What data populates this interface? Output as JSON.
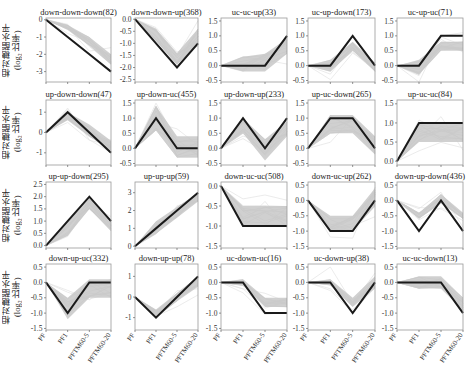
{
  "chart_data": {
    "type": "line",
    "layout": {
      "rows": 4,
      "cols": 5,
      "grid": false,
      "legend": "none"
    },
    "ylabel": "相对糖酯水平\n(log2 比率)",
    "ylabel_lines": [
      "相对糖酯水平",
      "(log",
      "2",
      " 比率)"
    ],
    "x": [
      "PF",
      "PF1",
      "PFTM60-5",
      "PFTM60-20"
    ],
    "xtick_labels": [
      "PF",
      "PF1",
      "PFTM60-5",
      "PFTM60-20"
    ],
    "background_lines_color": "#c8c8c8",
    "representative_line_color": "#1a1a1a",
    "panels": [
      {
        "title": "down-down-down(82)",
        "values": [
          0,
          -1,
          -2,
          -3
        ],
        "ylim": [
          -3.6,
          0.1
        ],
        "yticks": [
          0,
          -1,
          -2,
          -3
        ],
        "yticklabels": [
          "0",
          "-1",
          "-2",
          "-3"
        ],
        "band": [
          [
            0,
            0
          ],
          [
            -0.6,
            -0.3
          ],
          [
            -1.5,
            -1.0
          ],
          [
            -2.6,
            -2.0
          ]
        ]
      },
      {
        "title": "down-down-up(368)",
        "values": [
          0,
          -1,
          -2,
          -1
        ],
        "ylim": [
          -2.6,
          0.05
        ],
        "yticks": [
          0,
          -0.5,
          -1,
          -1.5,
          -2,
          -2.5
        ],
        "yticklabels": [
          "0.0",
          "-0.5",
          "-1.0",
          "-1.5",
          "-2.0",
          "-2.5"
        ],
        "band": [
          [
            0,
            0
          ],
          [
            -0.9,
            -0.4
          ],
          [
            -1.9,
            -1.4
          ],
          [
            -1.0,
            -0.4
          ]
        ]
      },
      {
        "title": "uc-uc-up(33)",
        "values": [
          0,
          0,
          0,
          1
        ],
        "ylim": [
          -0.55,
          1.6
        ],
        "yticks": [
          1.5,
          1.0,
          0.5,
          0.0,
          -0.5
        ],
        "yticklabels": [
          "1.5",
          "1.0",
          "0.5",
          "0.0",
          "-0.5"
        ],
        "band": [
          [
            0,
            0
          ],
          [
            -0.2,
            0.3
          ],
          [
            -0.2,
            0.4
          ],
          [
            0.4,
            0.9
          ]
        ]
      },
      {
        "title": "uc-up-down(173)",
        "values": [
          0,
          0,
          1,
          0
        ],
        "ylim": [
          -0.55,
          1.6
        ],
        "yticks": [
          1.5,
          1.0,
          0.5,
          0.0,
          -0.5
        ],
        "yticklabels": [
          "1.5",
          "1.0",
          "0.5",
          "0.0",
          "-0.5"
        ],
        "band": [
          [
            0,
            0
          ],
          [
            -0.2,
            0.2
          ],
          [
            0.5,
            0.8
          ],
          [
            -0.2,
            0.1
          ]
        ]
      },
      {
        "title": "uc-up-uc(71)",
        "values": [
          0,
          0,
          1,
          1
        ],
        "ylim": [
          -0.55,
          1.6
        ],
        "yticks": [
          1.5,
          1.0,
          0.5,
          0.0,
          -0.5
        ],
        "yticklabels": [
          "1.5",
          "1.0",
          "0.5",
          "0.0",
          "-0.5"
        ],
        "band": [
          [
            0,
            0
          ],
          [
            -0.3,
            0.2
          ],
          [
            0.5,
            0.8
          ],
          [
            0.5,
            0.8
          ]
        ]
      },
      {
        "title": "up-down-down(47)",
        "values": [
          0,
          1,
          0,
          -1
        ],
        "ylim": [
          -1.6,
          1.6
        ],
        "yticks": [
          1,
          0,
          -1
        ],
        "yticklabels": [
          "1",
          "0",
          "-1"
        ],
        "band": [
          [
            0,
            0
          ],
          [
            0.6,
            1.0
          ],
          [
            -0.2,
            0.4
          ],
          [
            -0.9,
            -0.4
          ]
        ]
      },
      {
        "title": "up-down-uc(455)",
        "values": [
          0,
          1,
          0,
          0
        ],
        "ylim": [
          -0.55,
          1.6
        ],
        "yticks": [
          1.5,
          1.0,
          0.5,
          0.0,
          -0.5
        ],
        "yticklabels": [
          "1.5",
          "1.0",
          "0.5",
          "0.0",
          "-0.5"
        ],
        "band": [
          [
            0,
            0
          ],
          [
            0.6,
            1.4
          ],
          [
            -0.3,
            0.4
          ],
          [
            -0.3,
            0.4
          ]
        ]
      },
      {
        "title": "up-down-up(233)",
        "values": [
          0,
          1,
          0,
          1
        ],
        "ylim": [
          -0.55,
          1.6
        ],
        "yticks": [
          1.5,
          1.0,
          0.5,
          0.0,
          -0.5
        ],
        "yticklabels": [
          "1.5",
          "1.0",
          "0.5",
          "0.0",
          "-0.5"
        ],
        "band": [
          [
            0,
            0
          ],
          [
            0.5,
            1.0
          ],
          [
            -0.4,
            0.3
          ],
          [
            0.4,
            0.9
          ]
        ]
      },
      {
        "title": "up-uc-down(265)",
        "values": [
          0,
          1,
          1,
          0
        ],
        "ylim": [
          -0.55,
          1.6
        ],
        "yticks": [
          1.5,
          1.0,
          0.5,
          0.0,
          -0.5
        ],
        "yticklabels": [
          "1.5",
          "1.0",
          "0.5",
          "0.0",
          "-0.5"
        ],
        "band": [
          [
            0,
            0
          ],
          [
            0.5,
            1.1
          ],
          [
            0.5,
            1.1
          ],
          [
            -0.2,
            0.4
          ]
        ]
      },
      {
        "title": "up-uc-uc(84)",
        "values": [
          0,
          1,
          1,
          1
        ],
        "ylim": [
          -0.1,
          1.6
        ],
        "yticks": [
          1.5,
          1.0,
          0.5,
          0.0
        ],
        "yticklabels": [
          "1.5",
          "1.0",
          "0.5",
          "0.0"
        ],
        "band": [
          [
            0,
            0
          ],
          [
            0.5,
            1.0
          ],
          [
            0.5,
            1.0
          ],
          [
            0.5,
            1.0
          ]
        ]
      },
      {
        "title": "up-up-down(295)",
        "values": [
          0,
          1,
          2,
          1
        ],
        "ylim": [
          -0.1,
          2.6
        ],
        "yticks": [
          2.5,
          2.0,
          1.5,
          1.0,
          0.5,
          0.0
        ],
        "yticklabels": [
          "2.5",
          "2.0",
          "1.5",
          "1.0",
          "0.5",
          "0.0"
        ],
        "band": [
          [
            0,
            0
          ],
          [
            0.4,
            1.0
          ],
          [
            1.5,
            2.0
          ],
          [
            0.6,
            1.0
          ]
        ]
      },
      {
        "title": "up-up-up(59)",
        "values": [
          0,
          1,
          2,
          3
        ],
        "ylim": [
          -0.1,
          3.6
        ],
        "yticks": [
          3,
          2,
          1,
          0
        ],
        "yticklabels": [
          "3",
          "2",
          "1",
          "0"
        ],
        "band": [
          [
            0,
            0
          ],
          [
            0.7,
            1.4
          ],
          [
            1.6,
            2.2
          ],
          [
            2.5,
            3.0
          ]
        ]
      },
      {
        "title": "down-uc-uc(508)",
        "values": [
          0,
          -1,
          -1,
          -1
        ],
        "ylim": [
          -1.55,
          0.1
        ],
        "yticks": [
          0.0,
          -0.5,
          -1.0,
          -1.5
        ],
        "yticklabels": [
          "0.0",
          "-0.5",
          "-1.0",
          "-1.5"
        ],
        "band": [
          [
            0,
            0
          ],
          [
            -1.0,
            -0.5
          ],
          [
            -1.0,
            -0.5
          ],
          [
            -1.0,
            -0.5
          ]
        ]
      },
      {
        "title": "down-uc-up(262)",
        "values": [
          0,
          -1,
          -1,
          0
        ],
        "ylim": [
          -1.55,
          0.6
        ],
        "yticks": [
          0.5,
          0.0,
          -0.5,
          -1.0,
          -1.5
        ],
        "yticklabels": [
          "0.5",
          "0.0",
          "-0.5",
          "-1.0",
          "-1.5"
        ],
        "band": [
          [
            0,
            0
          ],
          [
            -1.0,
            -0.5
          ],
          [
            -1.0,
            -0.5
          ],
          [
            -0.2,
            0.4
          ]
        ]
      },
      {
        "title": "down-up-down(436)",
        "values": [
          0,
          -1,
          0,
          -1
        ],
        "ylim": [
          -1.55,
          0.6
        ],
        "yticks": [
          0.5,
          0.0,
          -0.5,
          -1.0,
          -1.5
        ],
        "yticklabels": [
          "0.5",
          "0.0",
          "-0.5",
          "-1.0",
          "-1.5"
        ],
        "band": [
          [
            0,
            0
          ],
          [
            -0.6,
            -0.4
          ],
          [
            -0.1,
            0.2
          ],
          [
            -0.6,
            -0.4
          ]
        ]
      },
      {
        "title": "down-up-uc(332)",
        "values": [
          0,
          -1,
          0,
          0
        ],
        "ylim": [
          -1.55,
          0.6
        ],
        "yticks": [
          0.5,
          0.0,
          -0.5,
          -1.0,
          -1.5
        ],
        "yticklabels": [
          "0.5",
          "0.0",
          "-0.5",
          "-1.0",
          "-1.5"
        ],
        "band": [
          [
            0,
            0
          ],
          [
            -1.2,
            -0.5
          ],
          [
            -0.5,
            0.1
          ],
          [
            -0.5,
            0.1
          ]
        ]
      },
      {
        "title": "down-up-up(78)",
        "values": [
          0,
          -1,
          0,
          1
        ],
        "ylim": [
          -1.6,
          1.6
        ],
        "yticks": [
          1,
          0,
          -1
        ],
        "yticklabels": [
          "1",
          "0",
          "-1"
        ],
        "band": [
          [
            0,
            0
          ],
          [
            -1.0,
            -0.6
          ],
          [
            -0.2,
            0.2
          ],
          [
            0.5,
            1.0
          ]
        ]
      },
      {
        "title": "uc-down-uc(16)",
        "values": [
          0,
          0,
          -1,
          -1
        ],
        "ylim": [
          -1.55,
          0.6
        ],
        "yticks": [
          0.5,
          0.0,
          -0.5,
          -1.0,
          -1.5
        ],
        "yticklabels": [
          "0.5",
          "0.0",
          "-0.5",
          "-1.0",
          "-1.5"
        ],
        "band": [
          [
            0,
            0
          ],
          [
            -0.1,
            0.1
          ],
          [
            -0.8,
            -0.5
          ],
          [
            -0.8,
            -0.5
          ]
        ]
      },
      {
        "title": "uc-down-up(38)",
        "values": [
          0,
          0,
          -1,
          0
        ],
        "ylim": [
          -1.55,
          0.6
        ],
        "yticks": [
          0.5,
          0.0,
          -0.5,
          -1.0,
          -1.5
        ],
        "yticklabels": [
          "0.5",
          "0.0",
          "-0.5",
          "-1.0",
          "-1.5"
        ],
        "band": [
          [
            0,
            0
          ],
          [
            -0.1,
            0.1
          ],
          [
            -0.8,
            -0.5
          ],
          [
            -0.2,
            0.2
          ]
        ]
      },
      {
        "title": "uc-uc-down(13)",
        "values": [
          0,
          0,
          0,
          -1
        ],
        "ylim": [
          -1.55,
          0.6
        ],
        "yticks": [
          0.5,
          0.0,
          -0.5,
          -1.0,
          -1.5
        ],
        "yticklabels": [
          "0.5",
          "0.0",
          "-0.5",
          "-1.0",
          "-1.5"
        ],
        "band": [
          [
            0,
            0
          ],
          [
            -0.2,
            0.2
          ],
          [
            -0.2,
            0.2
          ],
          [
            -0.9,
            -0.5
          ]
        ]
      }
    ]
  },
  "row_ylabels": [
    {
      "line1": "相对糖酯水平",
      "line2": "(log₂ 比率)"
    },
    {
      "line1": "相对糖酯水平",
      "line2": "(log₂ 比率)"
    },
    {
      "line1": "相对糖酯水平",
      "line2": "(log₂ 比率)"
    },
    {
      "line1": "相对糖酯水平",
      "line2": "(log₂ 比率)"
    }
  ]
}
